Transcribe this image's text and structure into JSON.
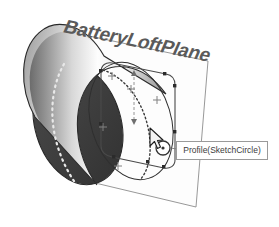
{
  "viewport": {
    "width": 279,
    "height": 227,
    "background_color": "#ffffff"
  },
  "plane": {
    "name": "plane-batteryloftplane",
    "label": "BatteryLoftPlane",
    "label_color": "#5a5a5a",
    "edge_color": "#8c8c8c",
    "fill_color": "#fbfbfb"
  },
  "solid": {
    "name": "battery-cylinder",
    "back_face_color": "#3f3f3f",
    "barrel_highlight_color": "#fdfdfd",
    "barrel_shadow_color": "#6e6e6e",
    "rim_color": "#b4b4b4",
    "hidden_edge_color": "#e8e8e8",
    "outline_color": "#2b2b2b"
  },
  "sketch": {
    "name": "sketch-profile",
    "curve_color": "#4a4a4a",
    "point_color": "#2b2b2b",
    "marker_color": "#808080",
    "projected_arc_color": "#3a3a3a",
    "circle_handle_color": "#333333"
  },
  "tooltip": {
    "name": "profile-tooltip",
    "text": "Profile(SketchCircle)",
    "border_color": "#9a9a9a",
    "background_color": "#ffffff",
    "text_color": "#3b3b3b"
  },
  "cursor": {
    "name": "mouse-cursor",
    "color": "#2b2b2b",
    "x": 152,
    "y": 131
  }
}
